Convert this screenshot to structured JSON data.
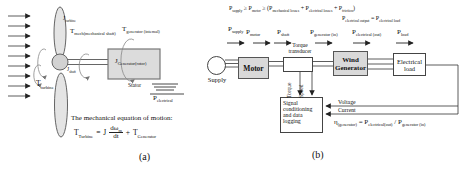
{
  "figure_a": {
    "caption": "(a)",
    "labels": {
      "j_turbine": [
        {
          "t": "J"
        },
        {
          "t": "turbine",
          "sub": true
        }
      ],
      "t_mech_shaft": [
        {
          "t": "T"
        },
        {
          "t": "mech(mechanical shaft)",
          "sub": true
        }
      ],
      "t_generator_internal": [
        {
          "t": "T"
        },
        {
          "t": "generator (internal)",
          "sub": true
        }
      ],
      "j_shaft": [
        {
          "t": "J"
        },
        {
          "t": "shaft",
          "sub": true
        }
      ],
      "j_generator_rotor": [
        {
          "t": "J"
        },
        {
          "t": "Generator(rotor)",
          "sub": true
        }
      ],
      "t_turbine": [
        {
          "t": "T"
        },
        {
          "t": "turbine",
          "sub": true
        }
      ],
      "stator": "Stator",
      "p_electrical": [
        {
          "t": "P"
        },
        {
          "t": "electrical",
          "sub": true
        }
      ]
    },
    "motion_heading": "The mechanical equation of motion:",
    "equation": {
      "lhs": [
        {
          "t": "T"
        },
        {
          "t": "Turbine",
          "sub": true
        }
      ],
      "equals": "=",
      "inertia": "J",
      "numerator": [
        {
          "t": "dω"
        },
        {
          "t": "m",
          "sub": true
        }
      ],
      "denominator": "dt",
      "plus": "+",
      "rhs": [
        {
          "t": "T"
        },
        {
          "t": "Generator",
          "sub": true
        }
      ]
    }
  },
  "figure_b": {
    "caption": "(b)",
    "power_balance": {
      "line1": [
        {
          "t": "P"
        },
        {
          "t": "supply",
          "sub": true
        },
        {
          "t": " ≥ P"
        },
        {
          "t": "motor",
          "sub": true
        },
        {
          "t": " ≥ (P"
        },
        {
          "t": "mechanical losses",
          "sub": true
        },
        {
          "t": " + P"
        },
        {
          "t": "electrical losses",
          "sub": true
        },
        {
          "t": " + P"
        },
        {
          "t": "friction",
          "sub": true
        },
        {
          "t": ")"
        }
      ],
      "line2": [
        {
          "t": "P"
        },
        {
          "t": "electrical output",
          "sub": true
        },
        {
          "t": " = P"
        },
        {
          "t": "electrical load",
          "sub": true
        }
      ]
    },
    "flow_labels": [
      {
        "label": [
          {
            "t": "P"
          },
          {
            "t": "supply",
            "sub": true
          }
        ]
      },
      {
        "label": [
          {
            "t": "P"
          },
          {
            "t": "motor",
            "sub": true
          }
        ]
      },
      {
        "label": [
          {
            "t": "P"
          },
          {
            "t": "shaft",
            "sub": true
          }
        ]
      },
      {
        "label": [
          {
            "t": "P"
          },
          {
            "t": "generator (in)",
            "sub": true
          }
        ]
      },
      {
        "label": [
          {
            "t": "P"
          },
          {
            "t": "electrical (out)",
            "sub": true
          }
        ]
      },
      {
        "label": [
          {
            "t": "P"
          },
          {
            "t": "load",
            "sub": true
          }
        ]
      }
    ],
    "blocks": {
      "supply": "Supply",
      "motor": "Motor",
      "transducer": "Torque transducer",
      "generator": "Wind Generator",
      "load": "Electrical load",
      "signal": "Signal conditioning and data logging"
    },
    "signals": {
      "torque": "Torque",
      "speed": "Speed",
      "voltage": "Voltage",
      "current": "Current"
    },
    "efficiency": [
      {
        "t": "η"
      },
      {
        "t": "(generator)",
        "sub": true
      },
      {
        "t": " = P"
      },
      {
        "t": "electrical(out)",
        "sub": true
      },
      {
        "t": " / P"
      },
      {
        "t": "generator (in)",
        "sub": true
      }
    ]
  },
  "colors": {
    "box_fill": "#d9d9d9",
    "line": "#333333",
    "rotation_arrow": "#888888"
  }
}
